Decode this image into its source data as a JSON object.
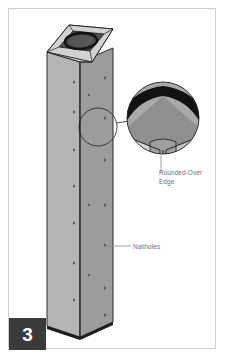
{
  "figure": {
    "step_number": "3",
    "title_alt": "Hollow built-up post with rounded-over edge detail",
    "callouts": [
      {
        "id": "rounded-over-edge",
        "text": "Rounded-Over\nEdge"
      },
      {
        "id": "nailholes",
        "text": "Nailholes"
      }
    ],
    "detail_circle": {
      "label": "rounded-over edge magnified detail"
    },
    "colors": {
      "page_background": "#ffffff",
      "page_border": "#cfcfcf",
      "post_face_left": "#b4b4b4",
      "post_face_right": "#9a9a9a",
      "post_top_face": "#c9c9c9",
      "post_edge_line": "#1b1b1b",
      "rounded_edge_band": "#131313",
      "label_text": "#6f6f6f",
      "badge_background": "#3a3a3a",
      "badge_text": "#ffffff",
      "leader_line": "#8c8c8c"
    }
  }
}
